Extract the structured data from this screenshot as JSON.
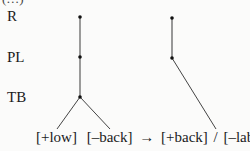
{
  "partial_top_text": "(…)",
  "tiers": [
    {
      "id": "R",
      "label": "R"
    },
    {
      "id": "PL",
      "label": "PL"
    },
    {
      "id": "TB",
      "label": "TB"
    }
  ],
  "left_tree": {
    "nodes": [
      "R",
      "PL",
      "TB"
    ],
    "terminals": [
      "[+low]",
      "[–back]"
    ]
  },
  "right_tree": {
    "nodes": [
      "R",
      "PL"
    ],
    "terminal": "[–lab]"
  },
  "rule": {
    "input_1": "[+low]",
    "input_2": "[–back]",
    "arrow": "→",
    "output": "[+back]",
    "slash": "/",
    "context": "[–lab]",
    "dash": "—"
  },
  "colors": {
    "background": "#fbfbfa",
    "ink": "#1a1a1a",
    "line": "#555555"
  }
}
